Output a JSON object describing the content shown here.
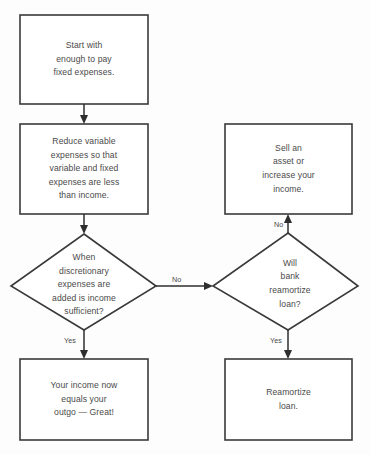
{
  "diagram": {
    "type": "flowchart",
    "background_color": "#fdfdfd",
    "stroke_color": "#3a3a3a",
    "text_color": "#4a4a4a",
    "nodes": [
      {
        "id": "start-fixed-expenses",
        "shape": "rectangle",
        "lines": [
          "Start with",
          "enough to pay",
          "fixed expenses."
        ]
      },
      {
        "id": "reduce-variable-expenses",
        "shape": "rectangle",
        "lines": [
          "Reduce variable",
          "expenses so that",
          "variable and fixed",
          "expenses are less",
          "than income."
        ]
      },
      {
        "id": "income-sufficient-decision",
        "shape": "diamond",
        "lines": [
          "When",
          "discretionary",
          "expenses are",
          "added is income",
          "sufficient?"
        ]
      },
      {
        "id": "income-equals-outgo",
        "shape": "rectangle",
        "lines": [
          "Your income now",
          "equals your",
          "outgo — Great!"
        ]
      },
      {
        "id": "sell-asset-increase-income",
        "shape": "rectangle",
        "lines": [
          "Sell an",
          "asset or",
          "increase your",
          "income."
        ]
      },
      {
        "id": "bank-reamortize-decision",
        "shape": "diamond",
        "lines": [
          "Will",
          "bank",
          "reamortize",
          "loan?"
        ]
      },
      {
        "id": "reamortize-loan",
        "shape": "rectangle",
        "lines": [
          "Reamortize",
          "loan."
        ]
      }
    ],
    "edges": [
      {
        "id": "start-to-reduce",
        "label": ""
      },
      {
        "id": "reduce-to-decision",
        "label": ""
      },
      {
        "id": "decision-yes-to-income-equals-outgo",
        "label": "Yes"
      },
      {
        "id": "decision-no-to-bank-decision",
        "label": "No"
      },
      {
        "id": "bank-no-to-sell-asset",
        "label": "No"
      },
      {
        "id": "bank-yes-to-reamortize",
        "label": "Yes"
      }
    ]
  }
}
